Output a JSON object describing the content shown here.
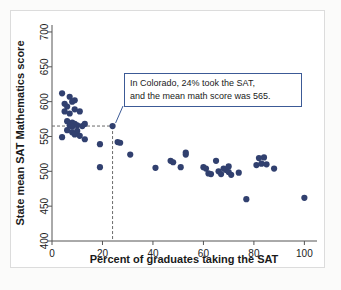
{
  "figure": {
    "caption_box": {
      "line1": "In Colorado, 24% took the SAT,",
      "line2": "and the mean math score was 565.",
      "border_color": "#3c5a96"
    }
  },
  "chart_data": {
    "type": "scatter",
    "title": "",
    "xlabel": "Percent of graduates taking the SAT",
    "ylabel": "State mean SAT Mathematics score",
    "xlim": [
      0,
      105
    ],
    "ylim": [
      400,
      710
    ],
    "xticks": [
      0,
      20,
      40,
      60,
      80,
      100
    ],
    "xticklabels": [
      "0",
      "20",
      "40",
      "60",
      "80",
      "100"
    ],
    "yticks": [
      400,
      450,
      500,
      550,
      600,
      650,
      700
    ],
    "yticklabels": [
      "400",
      "450",
      "500",
      "550",
      "600",
      "650",
      "700"
    ],
    "grid": false,
    "legend": null,
    "marker_color": "#31406f",
    "marker_size": 3.1,
    "highlight": {
      "label": "Colorado",
      "x": 24,
      "y": 565,
      "guide_style": "dashed",
      "guide_color": "#6a6a6a"
    },
    "points": [
      {
        "x": 4,
        "y": 612
      },
      {
        "x": 7,
        "y": 607
      },
      {
        "x": 5,
        "y": 597
      },
      {
        "x": 6,
        "y": 593
      },
      {
        "x": 9,
        "y": 602
      },
      {
        "x": 8,
        "y": 600
      },
      {
        "x": 5,
        "y": 586
      },
      {
        "x": 7,
        "y": 583
      },
      {
        "x": 9,
        "y": 589
      },
      {
        "x": 11,
        "y": 586
      },
      {
        "x": 6,
        "y": 572
      },
      {
        "x": 8,
        "y": 570
      },
      {
        "x": 9,
        "y": 568
      },
      {
        "x": 7,
        "y": 566
      },
      {
        "x": 8,
        "y": 564
      },
      {
        "x": 10,
        "y": 566
      },
      {
        "x": 12,
        "y": 565
      },
      {
        "x": 13,
        "y": 568
      },
      {
        "x": 6,
        "y": 559
      },
      {
        "x": 8,
        "y": 556
      },
      {
        "x": 10,
        "y": 558
      },
      {
        "x": 9,
        "y": 553
      },
      {
        "x": 4,
        "y": 549
      },
      {
        "x": 11,
        "y": 551
      },
      {
        "x": 13,
        "y": 546
      },
      {
        "x": 19,
        "y": 539
      },
      {
        "x": 19,
        "y": 506
      },
      {
        "x": 24,
        "y": 565
      },
      {
        "x": 26,
        "y": 542
      },
      {
        "x": 27,
        "y": 541
      },
      {
        "x": 31,
        "y": 524
      },
      {
        "x": 41,
        "y": 505
      },
      {
        "x": 47,
        "y": 515
      },
      {
        "x": 48,
        "y": 513
      },
      {
        "x": 51,
        "y": 506
      },
      {
        "x": 53,
        "y": 527
      },
      {
        "x": 53,
        "y": 524
      },
      {
        "x": 60,
        "y": 506
      },
      {
        "x": 61,
        "y": 504
      },
      {
        "x": 62,
        "y": 497
      },
      {
        "x": 63,
        "y": 496
      },
      {
        "x": 65,
        "y": 515
      },
      {
        "x": 66,
        "y": 500
      },
      {
        "x": 67,
        "y": 496
      },
      {
        "x": 68,
        "y": 504
      },
      {
        "x": 69,
        "y": 502
      },
      {
        "x": 70,
        "y": 507
      },
      {
        "x": 70,
        "y": 499
      },
      {
        "x": 71,
        "y": 495
      },
      {
        "x": 74,
        "y": 498
      },
      {
        "x": 77,
        "y": 460
      },
      {
        "x": 81,
        "y": 509
      },
      {
        "x": 82,
        "y": 519
      },
      {
        "x": 83,
        "y": 511
      },
      {
        "x": 84,
        "y": 520
      },
      {
        "x": 85,
        "y": 510
      },
      {
        "x": 88,
        "y": 504
      },
      {
        "x": 100,
        "y": 462
      }
    ]
  }
}
